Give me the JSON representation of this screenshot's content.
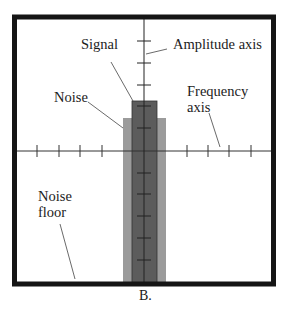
{
  "diagram": {
    "labels": {
      "signal": "Signal",
      "amplitude_axis": "Amplitude axis",
      "noise": "Noise",
      "frequency_axis_line1": "Frequency",
      "frequency_axis_line2": "axis",
      "noise_floor_line1": "Noise",
      "noise_floor_line2": "floor"
    },
    "caption": "B.",
    "colors": {
      "frame": "#151515",
      "signal_bar": "#5a5a5a",
      "noise_bar": "#9a9a9a",
      "axis": "#2a2a2a",
      "background": "#ffffff"
    }
  }
}
